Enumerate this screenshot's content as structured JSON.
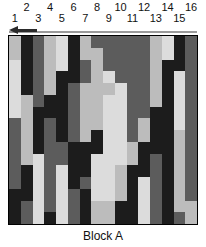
{
  "figure": {
    "caption": "Block A",
    "grid_size": 16,
    "direction_arrow": "left-arrow"
  },
  "column_labels": {
    "top_row": [
      "2",
      "4",
      "6",
      "8",
      "10",
      "12",
      "14",
      "16"
    ],
    "bottom_row": [
      "1",
      "3",
      "5",
      "7",
      "9",
      "11",
      "13",
      "15"
    ],
    "all": [
      "1",
      "2",
      "3",
      "4",
      "5",
      "6",
      "7",
      "8",
      "9",
      "10",
      "11",
      "12",
      "13",
      "14",
      "15",
      "16"
    ]
  },
  "palette": {
    "k": "#1c1c1c",
    "d": "#5c5c5c",
    "m": "#8e8e8e",
    "l": "#bcbcbc",
    "w": "#dcdcdc"
  },
  "chart_data": {
    "type": "heatmap",
    "title": "Block A",
    "xlabel": "",
    "ylabel": "",
    "grid": true,
    "legend": "none",
    "x": [
      "1",
      "2",
      "3",
      "4",
      "5",
      "6",
      "7",
      "8",
      "9",
      "10",
      "11",
      "12",
      "13",
      "14",
      "15",
      "16"
    ],
    "rows": [
      "lkdlwkldddddlwkd",
      "lkdlwkllddddlwkd",
      "wkdlwkdlddddlkkd",
      "wkdlkkdlwdddlkwd",
      "wkdlkdlllwddlkwd",
      "wldkkdllwwddlkwd",
      "wlkkkdllwwddkkwd",
      "dlkdkdllwwdlkkwd",
      "dlkdkdlkwwdlkkld",
      "dlkddkkkwwlkkkld",
      "dlwddkkwwwlkdkld",
      "dkwdwkkwwlkkdkld",
      "dkwdwkdwwlkwdkld",
      "kkwdwdkwwlkwdkld",
      "kdwdwdkllkkwdkll",
      "kdwkwdkllkkwdkdl"
    ]
  }
}
